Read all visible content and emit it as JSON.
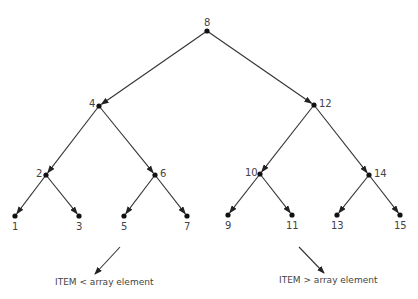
{
  "diagram": {
    "type": "binary-search-tree",
    "nodes": [
      {
        "id": "n8",
        "label": "8",
        "x": 207,
        "y": 31
      },
      {
        "id": "n4",
        "label": "4",
        "x": 99,
        "y": 106
      },
      {
        "id": "n12",
        "label": "12",
        "x": 314,
        "y": 105
      },
      {
        "id": "n2",
        "label": "2",
        "x": 46,
        "y": 175
      },
      {
        "id": "n6",
        "label": "6",
        "x": 155,
        "y": 175
      },
      {
        "id": "n10",
        "label": "10",
        "x": 260,
        "y": 174
      },
      {
        "id": "n14",
        "label": "14",
        "x": 369,
        "y": 175
      },
      {
        "id": "n1",
        "label": "1",
        "x": 15,
        "y": 216
      },
      {
        "id": "n3",
        "label": "3",
        "x": 79,
        "y": 216
      },
      {
        "id": "n5",
        "label": "5",
        "x": 124,
        "y": 216
      },
      {
        "id": "n7",
        "label": "7",
        "x": 187,
        "y": 216
      },
      {
        "id": "n9",
        "label": "9",
        "x": 228,
        "y": 215
      },
      {
        "id": "n11",
        "label": "11",
        "x": 292,
        "y": 215
      },
      {
        "id": "n13",
        "label": "13",
        "x": 337,
        "y": 215
      },
      {
        "id": "n15",
        "label": "15",
        "x": 400,
        "y": 215
      }
    ],
    "edges": [
      [
        "n8",
        "n4"
      ],
      [
        "n8",
        "n12"
      ],
      [
        "n4",
        "n2"
      ],
      [
        "n4",
        "n6"
      ],
      [
        "n12",
        "n10"
      ],
      [
        "n12",
        "n14"
      ],
      [
        "n2",
        "n1"
      ],
      [
        "n2",
        "n3"
      ],
      [
        "n6",
        "n5"
      ],
      [
        "n6",
        "n7"
      ],
      [
        "n10",
        "n9"
      ],
      [
        "n10",
        "n11"
      ],
      [
        "n14",
        "n13"
      ],
      [
        "n14",
        "n15"
      ]
    ],
    "labels": {
      "n8": "8",
      "n4": "4",
      "n12": "12",
      "n2": "2",
      "n6": "6",
      "n10": "10",
      "n14": "14",
      "n1": "1",
      "n3": "3",
      "n5": "5",
      "n7": "7",
      "n9": "9",
      "n11": "11",
      "n13": "13",
      "n15": "15"
    },
    "legend": {
      "left": "ITEM < array element",
      "right": "ITEM > array element"
    },
    "colors": {
      "line": "#333333",
      "node": "#111111",
      "text": "#444444"
    }
  }
}
